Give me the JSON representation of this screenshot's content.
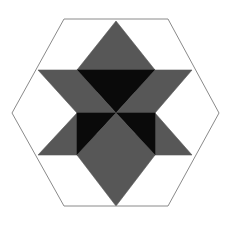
{
  "figure": {
    "type": "geometric-diagram",
    "canvas": {
      "width": 231,
      "height": 225,
      "background_color": "#ffffff"
    },
    "palette": {
      "background": "#ffffff",
      "gray_fill": "#575757",
      "black_fill": "#0a0a0a",
      "hexagon_outline": "#8a8a8a",
      "outline_width": 1
    },
    "outer_hexagon": {
      "name": "outer-hexagon",
      "orientation": "pointy-left-right",
      "fill": "none",
      "stroke": "#8a8a8a",
      "stroke_width": 1,
      "vertices": [
        [
          64,
          19
        ],
        [
          168,
          19
        ],
        [
          219,
          113
        ],
        [
          168,
          206
        ],
        [
          64,
          206
        ],
        [
          12,
          113
        ]
      ]
    },
    "star": {
      "name": "hexagram",
      "center": [
        116,
        113
      ],
      "outer_tips": [
        {
          "label": "top",
          "point": [
            116,
            21
          ]
        },
        {
          "label": "upper-right",
          "point": [
            192,
            70
          ]
        },
        {
          "label": "lower-right",
          "point": [
            192,
            155
          ]
        },
        {
          "label": "bottom",
          "point": [
            116,
            206
          ]
        },
        {
          "label": "lower-left",
          "point": [
            38,
            155
          ]
        },
        {
          "label": "upper-left",
          "point": [
            38,
            70
          ]
        }
      ],
      "inner_hexagon_vertices": [
        [
          116,
          21
        ],
        [
          155,
          70
        ],
        [
          155,
          155
        ],
        [
          116,
          206
        ],
        [
          77,
          155
        ],
        [
          77,
          70
        ]
      ]
    },
    "regions": [
      {
        "name": "star-point-top",
        "fill_key": "gray_fill",
        "color": "#575757",
        "points": "116,21 155,70 77,70"
      },
      {
        "name": "star-point-upper-right",
        "fill_key": "gray_fill",
        "color": "#575757",
        "points": "192,70 155,113 116,70"
      },
      {
        "name": "star-point-lower-right",
        "fill_key": "gray_fill",
        "color": "#575757",
        "points": "192,155 116,155 155,113"
      },
      {
        "name": "star-point-bottom",
        "fill_key": "gray_fill",
        "color": "#575757",
        "points": "116,206 77,155 155,155"
      },
      {
        "name": "star-point-lower-left",
        "fill_key": "gray_fill",
        "color": "#575757",
        "points": "38,155 77,113 116,155"
      },
      {
        "name": "star-point-upper-left",
        "fill_key": "gray_fill",
        "color": "#575757",
        "points": "38,70 116,70 77,113"
      },
      {
        "name": "core-triangle-top",
        "fill_key": "black_fill",
        "color": "#0a0a0a",
        "points": "77,70 155,70 116,113"
      },
      {
        "name": "core-triangle-upper-left",
        "fill_key": "gray_fill",
        "color": "#575757",
        "points": "77,70 116,113 77,113"
      },
      {
        "name": "core-triangle-upper-right",
        "fill_key": "gray_fill",
        "color": "#575757",
        "points": "155,70 155,113 116,113"
      },
      {
        "name": "core-triangle-lower-left",
        "fill_key": "black_fill",
        "color": "#0a0a0a",
        "points": "77,113 116,113 77,155"
      },
      {
        "name": "core-triangle-lower-right",
        "fill_key": "black_fill",
        "color": "#0a0a0a",
        "points": "155,113 155,155 116,113"
      },
      {
        "name": "core-triangle-bottom",
        "fill_key": "gray_fill",
        "color": "#575757",
        "points": "77,155 116,113 155,155"
      }
    ]
  }
}
